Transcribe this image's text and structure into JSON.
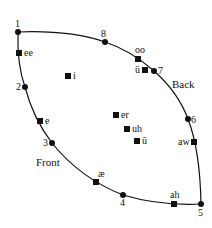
{
  "diagram": {
    "title": "",
    "region_labels": [
      {
        "id": "back",
        "text": "Back",
        "x": 172,
        "y": 88
      },
      {
        "id": "front",
        "text": "Front",
        "x": 36,
        "y": 166
      }
    ],
    "cardinal_points": [
      {
        "id": "1",
        "label": "1",
        "x": 18,
        "y": 32,
        "lx": 15,
        "ly": 27
      },
      {
        "id": "2",
        "label": "2",
        "x": 25,
        "y": 87,
        "lx": 16,
        "ly": 90
      },
      {
        "id": "3",
        "label": "3",
        "x": 52,
        "y": 143,
        "lx": 43,
        "ly": 146
      },
      {
        "id": "4",
        "label": "4",
        "x": 123,
        "y": 195,
        "lx": 120,
        "ly": 206
      },
      {
        "id": "5",
        "label": "5",
        "x": 201,
        "y": 204,
        "lx": 198,
        "ly": 216
      },
      {
        "id": "6",
        "label": "6",
        "x": 188,
        "y": 119,
        "lx": 191,
        "ly": 123
      },
      {
        "id": "7",
        "label": "7",
        "x": 154,
        "y": 71,
        "lx": 158,
        "ly": 74
      },
      {
        "id": "8",
        "label": "8",
        "x": 105,
        "y": 42,
        "lx": 101,
        "ly": 37
      }
    ],
    "vowels": [
      {
        "id": "ee",
        "label": "ee",
        "x": 19,
        "y": 53,
        "lx": 24,
        "ly": 56
      },
      {
        "id": "i",
        "label": "i",
        "x": 68,
        "y": 76,
        "lx": 73,
        "ly": 79
      },
      {
        "id": "e",
        "label": "e",
        "x": 40,
        "y": 121,
        "lx": 45,
        "ly": 124
      },
      {
        "id": "er",
        "label": "er",
        "x": 116,
        "y": 115,
        "lx": 121,
        "ly": 118
      },
      {
        "id": "uh",
        "label": "uh",
        "x": 127,
        "y": 129,
        "lx": 132,
        "ly": 132
      },
      {
        "id": "u-breve",
        "label": "ŭ",
        "x": 137,
        "y": 141,
        "lx": 142,
        "ly": 144
      },
      {
        "id": "ae",
        "label": "æ",
        "x": 96,
        "y": 182,
        "lx": 98,
        "ly": 177
      },
      {
        "id": "ah",
        "label": "ah",
        "x": 174,
        "y": 204,
        "lx": 170,
        "ly": 198
      },
      {
        "id": "aw",
        "label": "aw",
        "x": 194,
        "y": 142,
        "lx": 178,
        "ly": 145
      },
      {
        "id": "oo",
        "label": "oo",
        "x": 138,
        "y": 59,
        "lx": 135,
        "ly": 53
      },
      {
        "id": "u-macron",
        "label": "ū",
        "x": 145,
        "y": 70,
        "lx": 135,
        "ly": 73
      }
    ]
  }
}
